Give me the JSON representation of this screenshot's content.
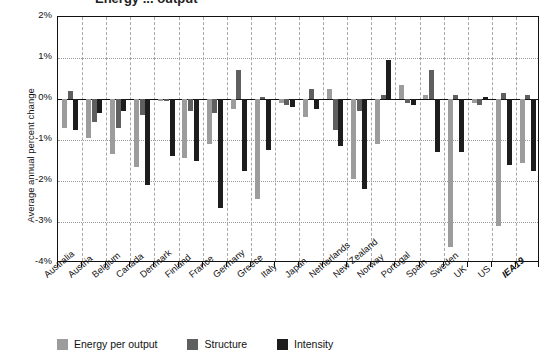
{
  "figure": {
    "title_partial": "Energy ... output",
    "background": "#ffffff"
  },
  "legend": {
    "position": "bottom-left",
    "items": [
      {
        "label": "Energy per output",
        "color": "#9c9c9c"
      },
      {
        "label": "Structure",
        "color": "#5f5f5f"
      },
      {
        "label": "Intensity",
        "color": "#1d1d1d"
      }
    ]
  },
  "axes": {
    "ylabel": "Average annual percent change",
    "xlabel": "",
    "yticks": [
      "2%",
      "1%",
      "0%",
      "-1%",
      "-2%",
      "-3%",
      "-4%"
    ],
    "ytick_values": [
      2,
      1,
      0,
      -1,
      -2,
      -3,
      -4
    ],
    "ylim": [
      -4,
      2
    ],
    "grid": "horizontal dotted + vertical dashed"
  },
  "chart_data": {
    "type": "bar",
    "title": "Energy ... output",
    "xlabel": "",
    "ylabel": "Average annual percent change",
    "ylim": [
      -4,
      2
    ],
    "yticks": [
      2,
      1,
      0,
      -1,
      -2,
      -3,
      -4
    ],
    "grid": true,
    "legend_position": "bottom-left",
    "categories": [
      "Australia",
      "Austria",
      "Belgium",
      "Canada",
      "Denmark",
      "Finland",
      "France",
      "Germany",
      "Greece",
      "Italy",
      "Japan",
      "Netherlands",
      "New Zealand",
      "Norway",
      "Portugal",
      "Spain",
      "Sweden",
      "UK",
      "US",
      "IEA19"
    ],
    "emphasized_category": "IEA19",
    "series": [
      {
        "name": "Energy per output",
        "color": "#9c9c9c",
        "values": [
          -0.7,
          -0.95,
          -1.35,
          -1.65,
          -0.05,
          -1.45,
          -1.1,
          -0.25,
          -2.45,
          -0.1,
          -0.45,
          0.25,
          -1.95,
          -1.1,
          0.35,
          0.1,
          -3.6,
          -0.1,
          -3.1,
          -1.55
        ]
      },
      {
        "name": "Structure",
        "color": "#5f5f5f",
        "values": [
          0.2,
          -0.55,
          -0.7,
          -0.4,
          -0.05,
          -0.3,
          -0.35,
          0.7,
          0.05,
          -0.15,
          0.25,
          -0.75,
          -0.3,
          0.1,
          -0.1,
          0.7,
          0.1,
          -0.15,
          0.15,
          0.1
        ]
      },
      {
        "name": "Intensity",
        "color": "#1d1d1d",
        "values": [
          -0.75,
          -0.35,
          -0.3,
          -2.1,
          -1.4,
          -1.5,
          -2.65,
          -1.75,
          -1.25,
          -0.2,
          -0.25,
          -1.15,
          -2.2,
          0.95,
          -0.15,
          -1.3,
          -1.3,
          0.05,
          -1.6,
          -1.75
        ]
      }
    ]
  }
}
